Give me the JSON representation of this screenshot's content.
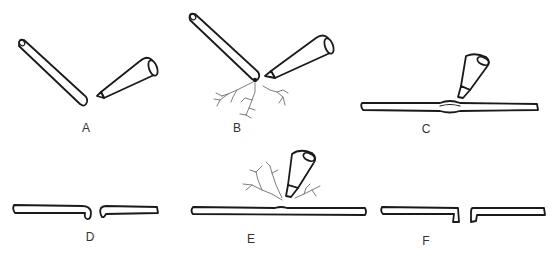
{
  "figure": {
    "panels": [
      {
        "id": "A",
        "label": "A",
        "elements": [
          "angled-fiber",
          "micropipette"
        ]
      },
      {
        "id": "B",
        "label": "B",
        "elements": [
          "angled-fiber",
          "micropipette",
          "branching-processes"
        ]
      },
      {
        "id": "C",
        "label": "C",
        "elements": [
          "horizontal-fiber-with-indent",
          "micropipette"
        ]
      },
      {
        "id": "D",
        "label": "D",
        "elements": [
          "severed-fiber-left",
          "severed-fiber-right"
        ]
      },
      {
        "id": "E",
        "label": "E",
        "elements": [
          "horizontal-fiber-with-indent",
          "micropipette",
          "branching-processes"
        ]
      },
      {
        "id": "F",
        "label": "F",
        "elements": [
          "severed-fiber-left",
          "severed-fiber-right"
        ]
      }
    ],
    "colors": {
      "ink": "#1a1a1a",
      "branches": "#6e6e6e",
      "background": "#ffffff",
      "label": "#333333"
    }
  }
}
